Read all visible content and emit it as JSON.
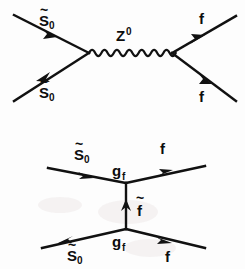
{
  "figure": {
    "background_color": "#fdfdfd",
    "ink_color": "#111111",
    "width": 245,
    "height": 269
  },
  "diagrams": [
    {
      "id": "s-channel-z",
      "name": "s-channel Z0 exchange",
      "channel": "s",
      "propagator": {
        "kind": "wavy",
        "label": "Z",
        "superscript": "0",
        "label_full": "Z⁰"
      },
      "incoming": [
        {
          "id": "in-upper-left",
          "label_base": "S",
          "label_tilde": "~",
          "label_subscript": "0",
          "label_full": "S̃0",
          "arrow_direction": "toward-vertex"
        },
        {
          "id": "in-lower-left",
          "label_base": "S",
          "label_tilde": "~",
          "label_subscript": "0",
          "label_full": "S̃0",
          "arrow_direction": "away-from-vertex"
        }
      ],
      "outgoing": [
        {
          "id": "out-upper-right",
          "label_base": "f",
          "label_full": "f",
          "arrow_direction": "away-from-vertex"
        },
        {
          "id": "out-lower-right",
          "label_base": "f",
          "label_full": "f",
          "arrow_direction": "toward-vertex"
        }
      ]
    },
    {
      "id": "t-channel-sfermion",
      "name": "t-channel sfermion exchange",
      "channel": "t",
      "propagator": {
        "kind": "straight-vertical",
        "label_base": "f",
        "label_tilde": "~",
        "label_full": "f̃",
        "arrow_direction": "upward"
      },
      "vertices": [
        {
          "id": "vertex-upper",
          "coupling_base": "g",
          "coupling_subscript": "f",
          "coupling_full": "g_f"
        },
        {
          "id": "vertex-lower",
          "coupling_base": "g",
          "coupling_subscript": "f",
          "coupling_full": "g_f"
        }
      ],
      "incoming": [
        {
          "id": "in-upper-left",
          "label_base": "S",
          "label_tilde": "~",
          "label_subscript": "0",
          "label_full": "S̃0",
          "arrow_direction": "toward-vertex"
        },
        {
          "id": "in-lower-left",
          "label_base": "S",
          "label_tilde": "~",
          "label_subscript": "0",
          "label_full": "S̃0",
          "arrow_direction": "away-from-vertex"
        }
      ],
      "outgoing": [
        {
          "id": "out-upper-right",
          "label_base": "f",
          "label_full": "f",
          "arrow_direction": "toward-vertex"
        },
        {
          "id": "out-lower-right",
          "label_base": "f",
          "label_full": "f",
          "arrow_direction": "away-from-vertex"
        }
      ]
    }
  ]
}
